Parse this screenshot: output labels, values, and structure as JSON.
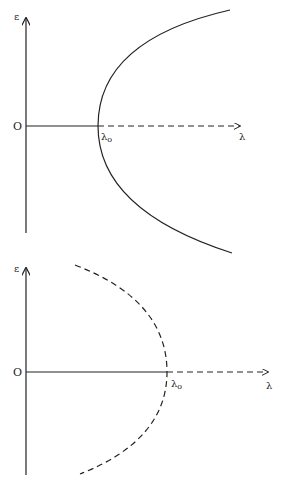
{
  "diagrams": [
    {
      "id": "top",
      "y_axis_label": "ε",
      "x_axis_label": "λ",
      "origin_label": "O",
      "critical_label": "λ",
      "critical_subscript": "o",
      "curve_style": "solid",
      "axis_continuation_style": "dashed",
      "description": "Parabola opening right with vertex at λo on λ-axis (solid)"
    },
    {
      "id": "bottom",
      "y_axis_label": "ε",
      "x_axis_label": "λ",
      "origin_label": "O",
      "critical_label": "λ",
      "critical_subscript": "o",
      "curve_style": "dashed",
      "axis_continuation_style": "dashed",
      "description": "Parabola opening left with vertex at λo on λ-axis (dashed)"
    }
  ],
  "colors": {
    "ink": "#222222",
    "background": "#ffffff"
  }
}
